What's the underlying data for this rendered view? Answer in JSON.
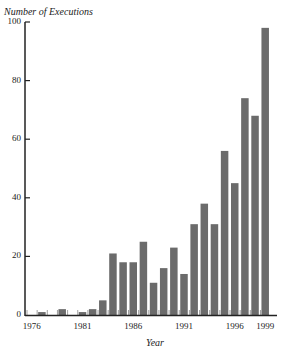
{
  "chart_data": {
    "type": "bar",
    "title": "",
    "ylabel": "Number of Executions",
    "xlabel": "Year",
    "ylim": [
      0,
      100
    ],
    "yticks": [
      0,
      20,
      40,
      60,
      80,
      100
    ],
    "xtick_labels": [
      "1976",
      "1981",
      "1986",
      "1991",
      "1996",
      "1999"
    ],
    "categories": [
      "1976",
      "1977",
      "1978",
      "1979",
      "1980",
      "1981",
      "1982",
      "1983",
      "1984",
      "1985",
      "1986",
      "1987",
      "1988",
      "1989",
      "1990",
      "1991",
      "1992",
      "1993",
      "1994",
      "1995",
      "1996",
      "1997",
      "1998",
      "1999"
    ],
    "values": [
      0,
      1,
      0,
      2,
      0,
      1,
      2,
      5,
      21,
      18,
      18,
      25,
      11,
      16,
      23,
      14,
      31,
      38,
      31,
      56,
      45,
      74,
      68,
      98
    ],
    "grid": false,
    "legend": null,
    "bar_color": "#6b6b6b",
    "axis_color": "#222222"
  },
  "labels": {
    "ylabel": "Number of Executions",
    "xlabel": "Year"
  }
}
